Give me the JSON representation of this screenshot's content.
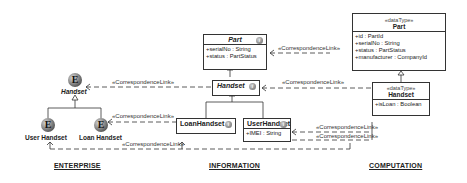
{
  "sections": {
    "enterprise": "ENTERPRISE",
    "information": "INFORMATION",
    "computation": "COMPUTATION"
  },
  "enterprise": {
    "icon_letter": "E",
    "handset": "Handset",
    "user_handset": "User Handset",
    "loan_handset": "Loan Handset"
  },
  "information": {
    "part": {
      "name": "Part",
      "attrs": [
        "+serialNo : String",
        "+status : PartStatus"
      ]
    },
    "handset": {
      "name": "Handset"
    },
    "loan_handset": {
      "name": "LoanHandset"
    },
    "user_handset": {
      "name": "UserHandset",
      "attrs": [
        "+IMEI : String"
      ]
    }
  },
  "computation": {
    "part": {
      "stereotype": "«dataType»",
      "name": "Part",
      "attrs": [
        "+id : PartId",
        "+serialNo : String",
        "+status : PartStatus",
        "+manufacturer : CompanyId"
      ]
    },
    "handset": {
      "stereotype": "«dataType»",
      "name": "Handset",
      "attrs": [
        "+isLoan : Boolean"
      ]
    }
  },
  "links": {
    "label": "«CorrespondenceLink»"
  },
  "colors": {
    "line": "#333333",
    "background": "#ffffff"
  }
}
